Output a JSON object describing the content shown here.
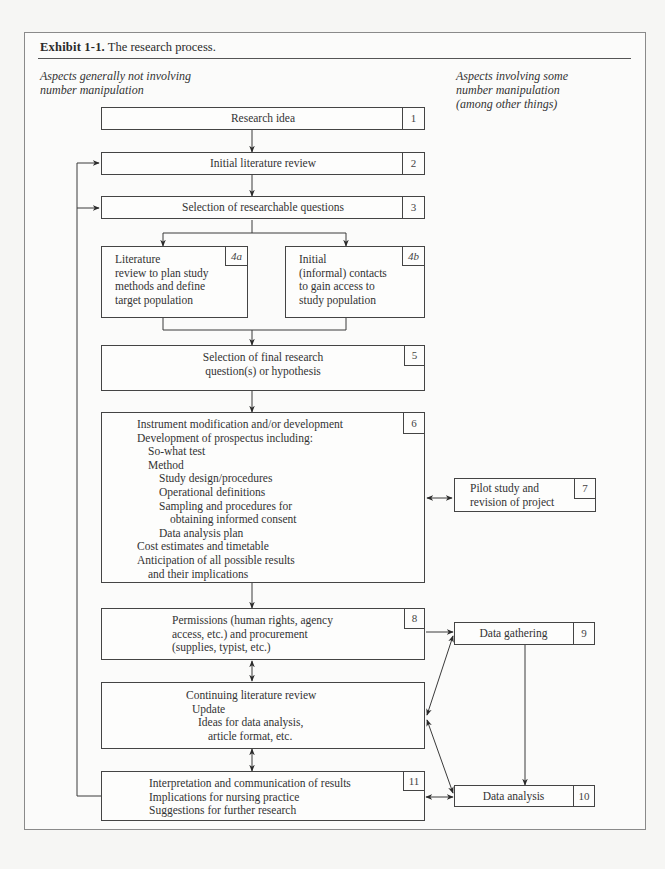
{
  "exhibit": {
    "label": "Exhibit 1-1.",
    "caption": "The research process."
  },
  "columns": {
    "left": [
      "Aspects generally not involving",
      "number manipulation"
    ],
    "right": [
      "Aspects involving some",
      "number manipulation",
      "(among other things)"
    ]
  },
  "boxes": {
    "b1": {
      "num": "1",
      "lines": [
        "Research idea"
      ]
    },
    "b2": {
      "num": "2",
      "lines": [
        "Initial literature review"
      ]
    },
    "b3": {
      "num": "3",
      "lines": [
        "Selection of researchable questions"
      ]
    },
    "b4a": {
      "num": "4a",
      "lines": [
        "Literature",
        "review to plan study",
        "methods and define",
        "target population"
      ]
    },
    "b4b": {
      "num": "4b",
      "lines": [
        "Initial",
        "(informal) contacts",
        "to gain access to",
        "study population"
      ]
    },
    "b5": {
      "num": "5",
      "lines": [
        "Selection of final research",
        "question(s) or hypothesis"
      ]
    },
    "b6": {
      "num": "6",
      "lines": [
        "Instrument modification and/or development",
        "Development of prospectus including:",
        "So-what test",
        "Method",
        "Study design/procedures",
        "Operational definitions",
        "Sampling and procedures for",
        "obtaining informed consent",
        "Data analysis plan",
        "Cost estimates and timetable",
        "Anticipation of all possible results",
        "and their implications"
      ]
    },
    "b7": {
      "num": "7",
      "lines": [
        "Pilot study and",
        "revision of project"
      ]
    },
    "b8": {
      "num": "8",
      "lines": [
        "Permissions (human rights, agency",
        "access, etc.) and procurement",
        "(supplies, typist, etc.)"
      ]
    },
    "bclr": {
      "num": "",
      "lines": [
        "Continuing literature review",
        "Update",
        "Ideas for data analysis,",
        "article format, etc."
      ]
    },
    "b9": {
      "num": "9",
      "lines": [
        "Data gathering"
      ]
    },
    "b10": {
      "num": "10",
      "lines": [
        "Data analysis"
      ]
    },
    "b11": {
      "num": "11",
      "lines": [
        "Interpretation and communication of results",
        "Implications for nursing practice",
        "Suggestions for further research"
      ]
    }
  },
  "colors": {
    "line": "#3a3a3a",
    "frame": "#8a8a8a",
    "background": "#f6f6f4"
  }
}
